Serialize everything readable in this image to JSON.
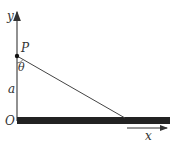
{
  "diagram": {
    "axis_labels": {
      "y": "y",
      "x": "x"
    },
    "point_label": "P",
    "angle_label": "θ",
    "distance_label": "a",
    "origin_label": "O",
    "colors": {
      "ink": "#333333",
      "bar": "#222222"
    }
  }
}
